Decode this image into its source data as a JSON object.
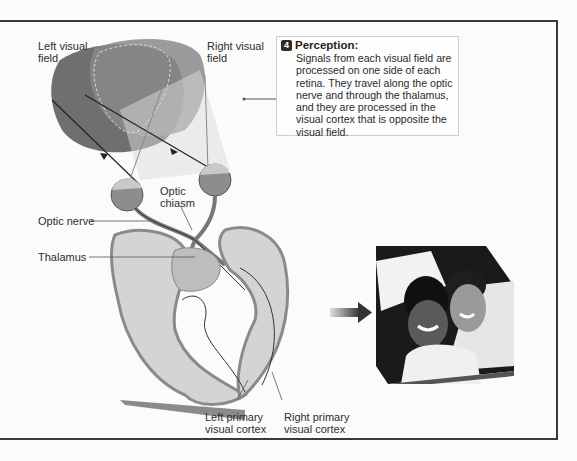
{
  "callout": {
    "step_number": "4",
    "title": "Perception:",
    "body": "Signals from each visual field are processed on one side of each retina. They travel along the optic nerve and through the thalamus, and they are processed in the visual cortex that is opposite the visual field."
  },
  "labels": {
    "left_visual_field": [
      "Left visual",
      "field"
    ],
    "right_visual_field": [
      "Right visual",
      "field"
    ],
    "optic_chiasm": [
      "Optic",
      "chiasm"
    ],
    "optic_nerve": "Optic nerve",
    "thalamus": "Thalamus",
    "left_primary_visual_cortex": [
      "Left primary",
      "visual cortex"
    ],
    "right_primary_visual_cortex": [
      "Right primary",
      "visual cortex"
    ]
  },
  "photo": {
    "description": "photo of smiling couple (grayscale)"
  },
  "colors": {
    "frame": "#3a3a3a",
    "left_field": "#6f6f6f",
    "right_field": "#8c8c8c",
    "cortex_light": "#d4d4d4",
    "cortex_dark": "#9a9a9a"
  }
}
